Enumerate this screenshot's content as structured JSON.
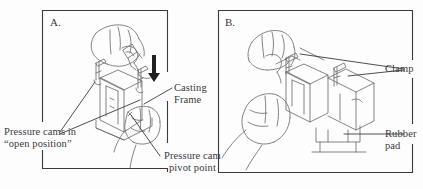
{
  "figure": {
    "type": "technical-instruction-diagram",
    "ink_color": "#3a3a3a",
    "border_color": "#2f2f2f",
    "background_color": "#fdfdfd",
    "arrow_color": "#1a1a1a"
  },
  "panels": [
    {
      "id": "A",
      "letter": "A.",
      "illustration": "hand-pressing-casting-frame-with-pressure-cams-open"
    },
    {
      "id": "B",
      "letter": "B.",
      "illustration": "hands-closing-clamps-on-casting-frame-over-rubber-pad"
    }
  ],
  "callouts": {
    "pressure_cams": {
      "line1": "Pressure cams in",
      "line2": "“open position”",
      "leader": "forked-two-prong",
      "panel": "A"
    },
    "casting_frame": {
      "line1": "Casting",
      "line2": "Frame",
      "leader": "single",
      "panel": "A"
    },
    "pivot_point": {
      "line1": "Pressure cam",
      "line2": "pivot point",
      "leader": "single",
      "panel": "A"
    },
    "clamp": {
      "line1": "Clamp",
      "line2": "",
      "leader": "forked-two-prong",
      "panel": "B"
    },
    "rubber_pad": {
      "line1": "Rubber",
      "line2": "pad",
      "leader": "single-horizontal",
      "panel": "B"
    }
  },
  "annotations": {
    "down_arrow": {
      "name": "downward-press-arrow",
      "panel": "A",
      "direction": "down"
    }
  }
}
